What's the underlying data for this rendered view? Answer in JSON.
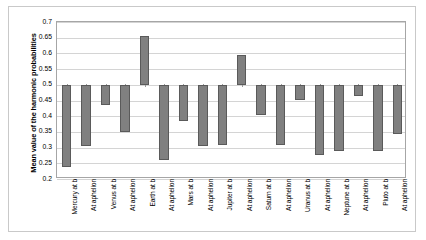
{
  "chart_data": {
    "type": "bar",
    "title": "",
    "xlabel": "",
    "ylabel": "Mean value of the harmonic probabilities",
    "ylim": [
      0.2,
      0.7
    ],
    "ytick_labels": [
      "0.7",
      "0.65",
      "0.6",
      "0.55",
      "0.5",
      "0.45",
      "0.4",
      "0.35",
      "0.3",
      "0.25",
      "0.2"
    ],
    "ytick_values": [
      0.7,
      0.65,
      0.6,
      0.55,
      0.5,
      0.45,
      0.4,
      0.35,
      0.3,
      0.25,
      0.2
    ],
    "baseline": 0.5,
    "grid": true,
    "legend": "none",
    "categories": [
      "Mercury at b",
      "At aphelion",
      "Venus at b",
      "At aphelion",
      "Earth at b",
      "At aphelion",
      "Mars at b",
      "At aphelion",
      "Jupiter at b",
      "At aphelion",
      "Saturn at b",
      "At aphelion",
      "Uranus at b",
      "At aphelion",
      "Neptune at b",
      "At aphelion",
      "Pluto at b",
      "At aphelion"
    ],
    "values": [
      0.238,
      0.305,
      0.437,
      0.35,
      0.656,
      0.262,
      0.385,
      0.305,
      0.308,
      0.596,
      0.405,
      0.308,
      0.45,
      0.278,
      0.288,
      0.463,
      0.288,
      0.343
    ],
    "bar_color": "#808080",
    "bar_border_color": "#5a5a5a",
    "gridline_color": "#d4d4d4",
    "plot_border_color": "#a6a6a6"
  }
}
